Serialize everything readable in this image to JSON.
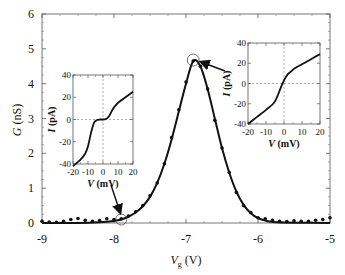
{
  "chart_data": {
    "type": "line",
    "title": "",
    "xlabel": "V_g (V)",
    "ylabel": "G (nS)",
    "xlim": [
      -9,
      -5
    ],
    "ylim": [
      0,
      6
    ],
    "x_ticks": [
      "-9",
      "-8",
      "-7",
      "-6",
      "-5"
    ],
    "y_ticks": [
      "0",
      "1",
      "2",
      "3",
      "4",
      "5",
      "6"
    ],
    "grid": false,
    "series": [
      {
        "name": "fit (solid line)",
        "style": "line",
        "x": [
          -9.0,
          -8.5,
          -8.2,
          -8.0,
          -7.9,
          -7.8,
          -7.7,
          -7.6,
          -7.5,
          -7.4,
          -7.3,
          -7.2,
          -7.1,
          -7.0,
          -6.9,
          -6.8,
          -6.7,
          -6.6,
          -6.5,
          -6.4,
          -6.3,
          -6.2,
          -6.1,
          -6.0,
          -5.9,
          -5.8,
          -5.5,
          -5.0
        ],
        "values": [
          0.0,
          0.0,
          0.02,
          0.06,
          0.1,
          0.18,
          0.3,
          0.48,
          0.75,
          1.15,
          1.7,
          2.4,
          3.2,
          4.0,
          4.65,
          4.5,
          3.85,
          3.0,
          2.15,
          1.45,
          0.9,
          0.52,
          0.28,
          0.14,
          0.07,
          0.03,
          0.01,
          0.0
        ]
      },
      {
        "name": "data (dots)",
        "style": "scatter",
        "x": [
          -9.0,
          -8.9,
          -8.8,
          -8.7,
          -8.6,
          -8.5,
          -8.4,
          -8.3,
          -8.2,
          -8.1,
          -8.0,
          -7.9,
          -7.8,
          -7.7,
          -7.6,
          -7.5,
          -7.4,
          -7.3,
          -7.2,
          -7.1,
          -7.0,
          -6.9,
          -6.8,
          -6.7,
          -6.6,
          -6.5,
          -6.4,
          -6.3,
          -6.2,
          -6.1,
          -6.0,
          -5.9,
          -5.8,
          -5.7,
          -5.6,
          -5.5,
          -5.4,
          -5.3,
          -5.2,
          -5.1,
          -5.0
        ],
        "values": [
          0.05,
          0.03,
          0.02,
          0.05,
          0.1,
          0.13,
          0.08,
          0.05,
          0.07,
          0.12,
          0.1,
          0.12,
          0.2,
          0.32,
          0.5,
          0.78,
          1.15,
          1.7,
          2.45,
          3.25,
          4.05,
          4.65,
          4.5,
          3.85,
          2.95,
          2.15,
          1.45,
          0.88,
          0.5,
          0.3,
          0.15,
          0.12,
          0.08,
          0.05,
          0.04,
          0.06,
          0.05,
          0.05,
          0.08,
          0.1,
          0.15
        ]
      }
    ],
    "annotations": [
      {
        "type": "circle",
        "x": -7.9,
        "y": 0.1,
        "arrow_to": "left inset"
      },
      {
        "type": "circle",
        "x": -6.9,
        "y": 4.65,
        "arrow_to": "right inset"
      }
    ],
    "insets": [
      {
        "name": "left inset (I-V at Vg≈-7.9 V, Coulomb blockade)",
        "type": "line",
        "xlabel": "V (mV)",
        "ylabel": "I (pA)",
        "xlim": [
          -20,
          20
        ],
        "ylim": [
          -40,
          40
        ],
        "x_ticks": [
          "-20",
          "-10",
          "0",
          "10",
          "20"
        ],
        "y_ticks": [
          "40",
          "20",
          "0",
          "-20",
          "-40"
        ],
        "dashed_zero_lines": true,
        "x": [
          -20,
          -15,
          -12,
          -10,
          -8,
          -6,
          -4,
          -2,
          0,
          2,
          4,
          6,
          8,
          10,
          12,
          15,
          20
        ],
        "values": [
          -42,
          -36,
          -31,
          -24,
          -12,
          -3,
          -0.5,
          0,
          0,
          0.5,
          3,
          8,
          12,
          15,
          17,
          20,
          25
        ]
      },
      {
        "name": "right inset (I-V at Vg≈-6.9 V, peak)",
        "type": "line",
        "xlabel": "V (mV)",
        "ylabel": "I (pA)",
        "xlim": [
          -20,
          20
        ],
        "ylim": [
          -40,
          40
        ],
        "x_ticks": [
          "-20",
          "-10",
          "0",
          "10",
          "20"
        ],
        "y_ticks": [
          "40",
          "20",
          "0",
          "-20",
          "-40"
        ],
        "dashed_zero_lines": true,
        "x": [
          -20,
          -15,
          -10,
          -6,
          -4,
          -2,
          0,
          2,
          4,
          6,
          10,
          15,
          20
        ],
        "values": [
          -40,
          -33,
          -26,
          -20,
          -14,
          -5,
          3,
          9,
          12,
          15,
          19,
          24,
          29
        ]
      }
    ]
  },
  "axes": {
    "xlabel_main": "V",
    "xlabel_sub": "g",
    "xlabel_unit": " (V)",
    "ylabel": "G (nS)",
    "x_ticks": [
      "-9",
      "-8",
      "-7",
      "-6",
      "-5"
    ],
    "y_ticks": [
      "0",
      "1",
      "2",
      "3",
      "4",
      "5",
      "6"
    ],
    "inset_xlabel_var": "V",
    "inset_xlabel_unit": " (mV)",
    "inset_ylabel_var": "I",
    "inset_ylabel_unit": " (pA)",
    "inset_x_ticks": [
      "-20",
      "-10",
      "0",
      "10",
      "20"
    ],
    "inset_y_ticks": [
      "40",
      "20",
      "0",
      "-20",
      "-40"
    ]
  }
}
